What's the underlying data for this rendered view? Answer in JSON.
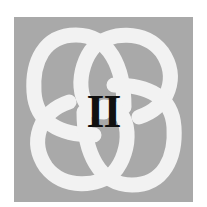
{
  "emblem": {
    "numeral": "II",
    "icon": "interlaced-knot-icon",
    "colors": {
      "background": "#a9a9a9",
      "knot": "#f2f2f2",
      "numeral": "#111111",
      "page": "#ffffff"
    }
  }
}
